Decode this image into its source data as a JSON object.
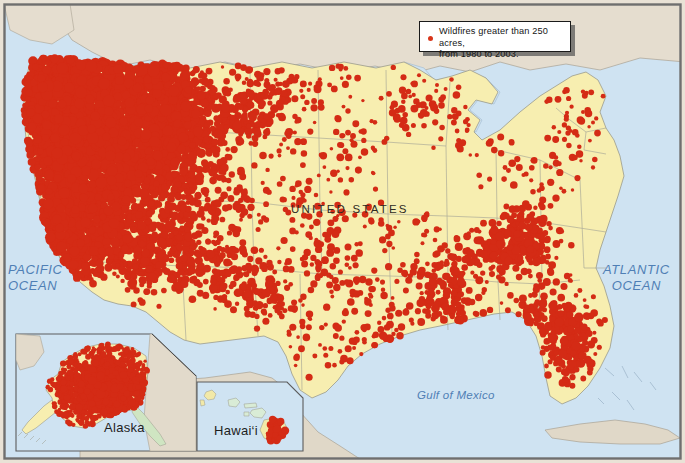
{
  "map": {
    "title_label": "UNITED STATES",
    "theme": "Wildfires greater than 250 acres, from 1980 to 2003",
    "legend": {
      "symbol": "red-dot-icon",
      "line1": "Wildfires greater than 250 acres,",
      "line2": "from 1980 to 2003."
    },
    "water_labels": [
      {
        "name": "pacific-ocean",
        "line1": "PACIFIC",
        "line2": "OCEAN"
      },
      {
        "name": "atlantic-ocean",
        "line1": "ATLANTIC",
        "line2": "OCEAN"
      },
      {
        "name": "gulf-of-mexico",
        "line1": "Gulf of Mexico",
        "line2": ""
      }
    ],
    "insets": [
      {
        "name": "alaska",
        "label": "Alaska"
      },
      {
        "name": "hawaii",
        "label": "Hawai‘i"
      }
    ],
    "colors": {
      "ocean": "#cfe3f2",
      "us_land": "#f7eeb0",
      "foreign_land": "#e2dacb",
      "wildfire": "#d42b15",
      "border": "#9a9a8c",
      "frame": "#6f6f6f",
      "label_blue": "#4f7fb5",
      "background": "#e9e2d6"
    }
  },
  "chart_data": {
    "type": "map",
    "title": "Wildfires greater than 250 acres, from 1980 to 2003",
    "legend_entries": [
      "Wildfires greater than 250 acres, from 1980 to 2003."
    ],
    "region_density": [
      {
        "region": "Pacific Northwest",
        "density": "very high"
      },
      {
        "region": "Great Basin / Nevada",
        "density": "very high"
      },
      {
        "region": "Idaho / Montana",
        "density": "very high"
      },
      {
        "region": "California",
        "density": "very high"
      },
      {
        "region": "Southwest / Arizona / New Mexico",
        "density": "high"
      },
      {
        "region": "Great Plains",
        "density": "moderate"
      },
      {
        "region": "Southeast / Florida",
        "density": "high"
      },
      {
        "region": "Northeast",
        "density": "low"
      },
      {
        "region": "Alaska",
        "density": "very high"
      },
      {
        "region": "Hawai‘i",
        "density": "moderate"
      }
    ]
  }
}
